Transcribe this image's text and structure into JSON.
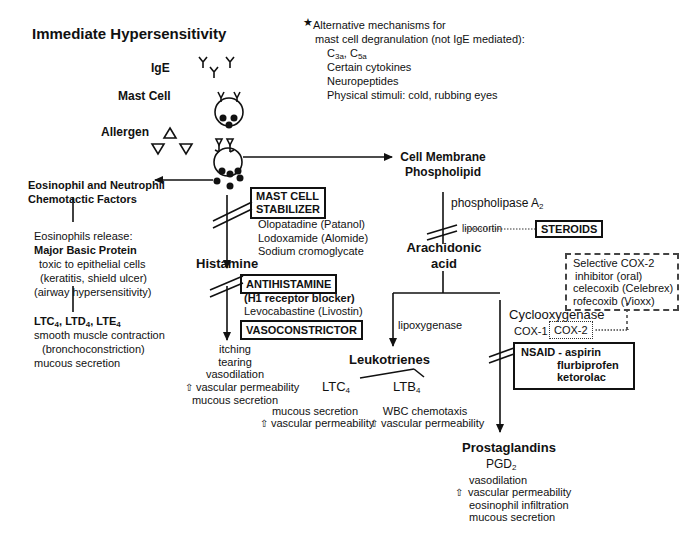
{
  "title": "Immediate Hypersensitivity",
  "labels": {
    "ige": "IgE",
    "mast_cell": "Mast Cell",
    "allergen": "Allergen"
  },
  "alternative": {
    "star_icon": "star",
    "heading1": "Alternative mechanisms for",
    "heading2": "mast cell degranulation  (not IgE mediated):",
    "items": [
      "C3a, C5a",
      "Certain cytokines",
      "Neuropeptides",
      "Physical stimuli:  cold, rubbing eyes"
    ]
  },
  "eosinophil": {
    "title1": "Eosinophil and Neutrophil",
    "title2": "Chemotactic Factors",
    "release": "Eosinophils release:",
    "mbp": "Major Basic Protein",
    "mbp_lines": [
      "toxic to epithelial cells",
      "(keratitis, shield ulcer)",
      "(airway hypersensitivity)"
    ],
    "lt_title": "LTC4, LTD4, LTE4",
    "lt_lines": [
      "smooth muscle contraction",
      "(bronchoconstriction)",
      "mucous secretion"
    ]
  },
  "histamine_path": {
    "stabilizer_box": [
      "MAST CELL",
      "STABILIZER"
    ],
    "stabilizer_drugs": [
      "Olopatadine (Patanol)",
      "Lodoxamide (Alomide)",
      "Sodium cromoglycate"
    ],
    "histamine": "Histamine",
    "antihistamine_box": "ANTIHISTAMINE",
    "h1": "(H1 receptor blocker)",
    "antihistamine_drug": "Levocabastine (Livostin)",
    "vasoconstrictor_box": "VASOCONSTRICTOR",
    "effects": [
      "itching",
      "tearing",
      "vasodilation",
      "vascular permeability",
      "mucous secretion"
    ]
  },
  "membrane_path": {
    "cell_membrane1": "Cell Membrane",
    "cell_membrane2": "Phospholipid",
    "phospholipase": "phospholipase A2",
    "lipocortin": "lipocortin",
    "steroids_box": "STEROIDS",
    "arachidonic1": "Arachidonic",
    "arachidonic2": "acid",
    "lipoxygenase": "lipoxygenase",
    "leukotrienes": "Leukotrienes",
    "ltc4": "LTC4",
    "ltb4": "LTB4",
    "ltc4_effects": [
      "mucous secretion",
      "vascular permeability"
    ],
    "ltb4_effects": [
      "WBC chemotaxis",
      "vascular permeability"
    ],
    "cox2_box": [
      "Selective COX-2",
      "inhibitor (oral)",
      "celecoxib  (Celebrex)",
      "rofecoxib (Vioxx)"
    ],
    "cyclooxygenase": "Cyclooxygenase",
    "cox1": "COX-1",
    "cox2": "COX-2",
    "nsaid_box": [
      "NSAID - aspirin",
      "flurbiprofen",
      "ketorolac"
    ],
    "prostaglandins": "Prostaglandins",
    "pgd2": "PGD2",
    "pg_effects": [
      "vasodilation",
      "vascular permeability",
      "eosinophil infiltration",
      "mucous secretion"
    ]
  },
  "icons": {
    "up_arrow": "⇧"
  }
}
